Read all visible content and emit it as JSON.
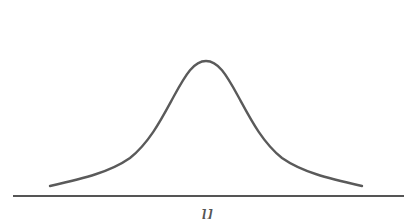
{
  "diagram": {
    "type": "normal-distribution",
    "axis_label": "μ",
    "colors": {
      "curve": "#5a5a5a",
      "axis": "#555555",
      "background": "#ffffff"
    }
  }
}
